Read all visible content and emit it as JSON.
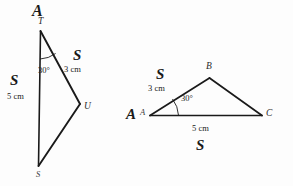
{
  "figure": {
    "stroke_color": "#1a1a1a",
    "background_color": "#fdfdfd"
  },
  "left_triangle": {
    "name": "triangle-TUS",
    "congruence_mark_side": "S",
    "congruence_mark_slant": "S",
    "vertices": [
      {
        "id": "T",
        "label": "T"
      },
      {
        "id": "U",
        "label": "U"
      },
      {
        "id": "S",
        "label": "S"
      }
    ],
    "side_left_length": "5 cm",
    "side_slant_length": "3 cm",
    "angle_label": "30°",
    "top_mark": "A"
  },
  "right_triangle": {
    "name": "triangle-ABC",
    "congruence_mark_slant": "S",
    "congruence_mark_base": "S",
    "congruence_mark_angle": "A",
    "vertices": [
      {
        "id": "A",
        "label": "A"
      },
      {
        "id": "B",
        "label": "B"
      },
      {
        "id": "C",
        "label": "C"
      }
    ],
    "side_slant_length": "3 cm",
    "side_base_length": "5 cm",
    "angle_label": "30°"
  }
}
